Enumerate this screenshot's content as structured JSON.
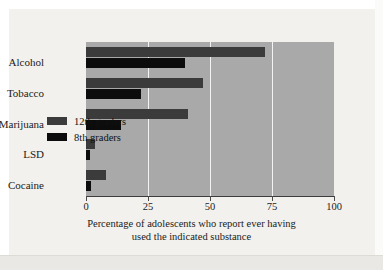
{
  "chart_data": {
    "type": "bar",
    "orientation": "horizontal",
    "title": "",
    "categories": [
      "Alcohol",
      "Tobacco",
      "Marijuana",
      "LSD",
      "Cocaine"
    ],
    "series": [
      {
        "name": "12th graders",
        "color": "#3b3b3b",
        "values": [
          72,
          47,
          41,
          3.5,
          8
        ]
      },
      {
        "name": "8th graders",
        "color": "#0c0c0c",
        "values": [
          40,
          22,
          14,
          1.5,
          2
        ]
      }
    ],
    "xlabel": "Percentage of adolescents who report ever having used the indicated substance",
    "ylabel": "",
    "xlim": [
      0,
      100
    ],
    "xticks": [
      0,
      25,
      50,
      75,
      100
    ],
    "xtick_labels": [
      "0",
      "25",
      "50",
      "75",
      "100"
    ],
    "gridlines": {
      "vertical": [
        25,
        50,
        75
      ],
      "color": "#f3f3f3"
    },
    "legend_position": "inside-center-left",
    "plot_background": "#a9a9a9",
    "figure_background": "#f2f1ed"
  },
  "caption": {
    "line1": "Percentage of adolescents who report ever having",
    "line2": "used the indicated substance"
  },
  "legend": {
    "items": [
      {
        "label": "12th graders",
        "color": "#3b3b3b"
      },
      {
        "label": "8th graders",
        "color": "#0c0c0c"
      }
    ]
  }
}
